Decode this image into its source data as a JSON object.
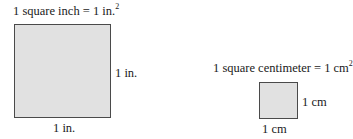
{
  "inch_figure": {
    "caption_text": "1 square inch = 1 in.",
    "caption_exponent": "2",
    "side_label_right": "1 in.",
    "side_label_bottom": "1 in.",
    "fill_color": "#e1e1e1",
    "border_color": "#4a4a4a"
  },
  "cm_figure": {
    "caption_text": "1 square centimeter = 1 cm",
    "caption_exponent": "2",
    "side_label_right": "1 cm",
    "side_label_bottom": "1 cm",
    "fill_color": "#e1e1e1",
    "border_color": "#4a4a4a"
  }
}
